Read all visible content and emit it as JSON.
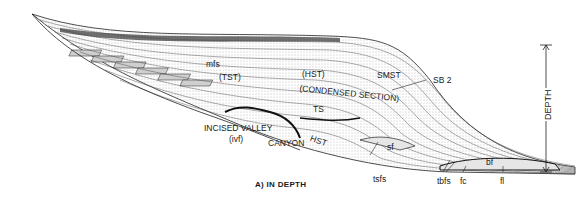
{
  "figure": {
    "caption": "A)  IN DEPTH",
    "axis_label": "DEPTH",
    "labels": {
      "mfs": "mfs",
      "tst": "(TST)",
      "hst_upper": "(HST)",
      "condensed": "(CONDENSED SECTION)",
      "smst": "SMST",
      "sb2": "SB 2",
      "ts": "TS",
      "incised_valley": "INCISED VALLEY",
      "ivf": "(ivf)",
      "canyon": "CANYON",
      "hst_lower": "HST",
      "sf": "sf",
      "tsfs": "tsfs",
      "tbfs": "tbfs",
      "fc": "fc",
      "bf": "bf",
      "fl": "fl"
    }
  },
  "colors": {
    "ink": "#1a1a1a",
    "shade_light": "#e6e6e6",
    "shade_mid": "#c8c8c8",
    "shade_dark": "#555555",
    "background": "#ffffff"
  }
}
